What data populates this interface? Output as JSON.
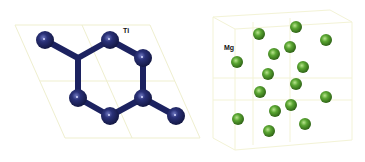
{
  "panels": [
    {
      "id": "ti",
      "label": "Ti",
      "label_pos": [
        123,
        33
      ],
      "atom_color": "#1c2260",
      "atom_radius": 9,
      "atoms": [
        [
          45,
          40
        ],
        [
          110,
          40
        ],
        [
          143,
          58
        ],
        [
          78,
          98
        ],
        [
          143,
          98
        ],
        [
          110,
          116
        ],
        [
          176,
          116
        ]
      ],
      "junctions": [
        [
          78,
          58
        ],
        [
          143,
          98
        ]
      ],
      "bonds": [
        [
          [
            45,
            40
          ],
          [
            78,
            58
          ]
        ],
        [
          [
            110,
            40
          ],
          [
            78,
            58
          ]
        ],
        [
          [
            78,
            58
          ],
          [
            78,
            98
          ]
        ],
        [
          [
            110,
            40
          ],
          [
            143,
            58
          ]
        ],
        [
          [
            143,
            58
          ],
          [
            143,
            98
          ]
        ],
        [
          [
            78,
            98
          ],
          [
            110,
            116
          ]
        ],
        [
          [
            110,
            116
          ],
          [
            143,
            98
          ]
        ],
        [
          [
            143,
            98
          ],
          [
            176,
            116
          ]
        ]
      ],
      "lattice_color": "#efefcf",
      "lattice_lines": [
        [
          [
            15,
            25
          ],
          [
            150,
            25
          ]
        ],
        [
          [
            150,
            25
          ],
          [
            200,
            138
          ]
        ],
        [
          [
            200,
            138
          ],
          [
            65,
            138
          ]
        ],
        [
          [
            65,
            138
          ],
          [
            15,
            25
          ]
        ],
        [
          [
            40,
            81
          ],
          [
            175,
            81
          ]
        ],
        [
          [
            82,
            25
          ],
          [
            132,
            138
          ]
        ]
      ]
    },
    {
      "id": "mg",
      "label": "Mg",
      "label_pos": [
        224,
        50
      ],
      "atom_color": "#4f9a2a",
      "atom_radius": 6,
      "atoms": [
        [
          259,
          34
        ],
        [
          296,
          27
        ],
        [
          326,
          40
        ],
        [
          237,
          62
        ],
        [
          274,
          54
        ],
        [
          290,
          47
        ],
        [
          268,
          74
        ],
        [
          303,
          67
        ],
        [
          296,
          84
        ],
        [
          260,
          92
        ],
        [
          326,
          97
        ],
        [
          291,
          105
        ],
        [
          275,
          111
        ],
        [
          238,
          119
        ],
        [
          305,
          124
        ],
        [
          269,
          131
        ]
      ],
      "lattice_color": "#f3f3d6",
      "lattice_lines": [
        [
          [
            213,
            17
          ],
          [
            330,
            10
          ]
        ],
        [
          [
            330,
            10
          ],
          [
            352,
            22
          ]
        ],
        [
          [
            352,
            22
          ],
          [
            352,
            140
          ]
        ],
        [
          [
            352,
            140
          ],
          [
            235,
            150
          ]
        ],
        [
          [
            235,
            150
          ],
          [
            213,
            138
          ]
        ],
        [
          [
            213,
            138
          ],
          [
            213,
            17
          ]
        ],
        [
          [
            235,
            29
          ],
          [
            352,
            22
          ]
        ],
        [
          [
            235,
            29
          ],
          [
            235,
            150
          ]
        ],
        [
          [
            235,
            29
          ],
          [
            213,
            17
          ]
        ],
        [
          [
            253,
            22
          ],
          [
            253,
            145
          ]
        ],
        [
          [
            290,
            18
          ],
          [
            290,
            142
          ]
        ],
        [
          [
            213,
            78
          ],
          [
            352,
            78
          ]
        ],
        [
          [
            213,
            100
          ],
          [
            352,
            100
          ]
        ]
      ]
    }
  ]
}
